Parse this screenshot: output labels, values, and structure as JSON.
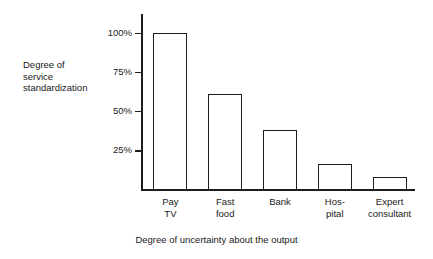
{
  "chart_data": {
    "type": "bar",
    "title": "",
    "categories": [
      "Pay TV",
      "Fast food",
      "Bank",
      "Hospital",
      "Expert consultant"
    ],
    "category_lines": [
      [
        "Pay",
        "TV"
      ],
      [
        "Fast",
        "food"
      ],
      [
        "Bank"
      ],
      [
        "Hos-",
        "pital"
      ],
      [
        "Expert",
        "consultant"
      ]
    ],
    "values": [
      100,
      61,
      38,
      16,
      8
    ],
    "xlabel": "Degree of uncertainty about the output",
    "ylabel": "Degree of service standardization",
    "ylabel_lines": [
      "Degree of",
      "service",
      "standardization"
    ],
    "ylim": [
      0,
      112
    ],
    "yticks": [
      25,
      50,
      75,
      100
    ],
    "ytick_labels": [
      "25%",
      "50%",
      "75%",
      "100%"
    ],
    "grid": false,
    "legend": "none",
    "bar_fill": "#ffffff",
    "bar_edge": "#1d1d1d",
    "axis_color": "#1d1d1d",
    "background": "#ffffff"
  }
}
